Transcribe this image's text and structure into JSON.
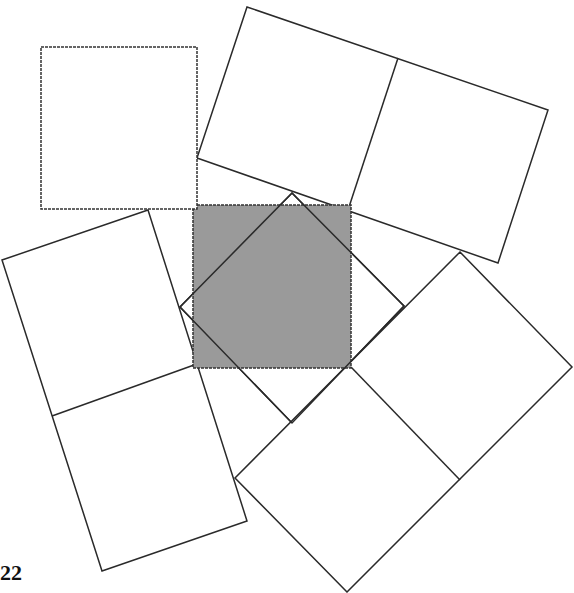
{
  "figure": {
    "label": "22",
    "colors": {
      "shaded": "#9a9a9a",
      "stroke": "#2a2a2a",
      "background": "#ffffff"
    },
    "shapes": [
      {
        "name": "top-left-square",
        "points": "41,47 197,47 197,209 41,209"
      },
      {
        "name": "top-right-rectangle",
        "points": "247,7 548,110 498,263 197,158",
        "divider": [
          398,
          58,
          348,
          210
        ]
      },
      {
        "name": "left-rectangle",
        "points": "2,260 148,210 247,521 102,571",
        "divider": [
          194,
          365,
          52,
          416
        ]
      },
      {
        "name": "bottom-right-rectangle",
        "points": "460,252 572,367 347,592 235,478",
        "divider": [
          351,
          367,
          460,
          480
        ]
      },
      {
        "name": "center-diamond",
        "points": "292,193 404,306 292,423 180,307"
      },
      {
        "name": "shaded-square",
        "points": "193,205 351,205 351,368 193,368"
      }
    ]
  }
}
